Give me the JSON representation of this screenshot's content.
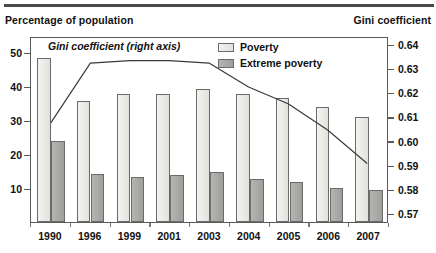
{
  "header": {
    "left_label": "Percentage of population",
    "right_label": "Gini coefficient"
  },
  "annotation": {
    "gini_series_note": "Gini coefficient (right axis)"
  },
  "legend": {
    "items": [
      {
        "label": "Poverty",
        "swatch": "light-gray-bar",
        "color": "#ECEAE6"
      },
      {
        "label": "Extreme poverty",
        "swatch": "dark-gray-bar",
        "color": "#A9A9A6"
      }
    ]
  },
  "chart_data": {
    "type": "bar",
    "title": "",
    "subtitle": "",
    "xlabel": "",
    "ylabel": "Percentage of population",
    "y2label": "Gini coefficient",
    "categories": [
      "1990",
      "1996",
      "1999",
      "2001",
      "2003",
      "2004",
      "2005",
      "2006",
      "2007"
    ],
    "series": [
      {
        "name": "Poverty",
        "kind": "bar",
        "axis": "left",
        "color": "#ECEAE6",
        "values": [
          48.4,
          35.8,
          37.8,
          37.8,
          39.3,
          38.0,
          36.8,
          34.0,
          31.2
        ]
      },
      {
        "name": "Extreme poverty",
        "kind": "bar",
        "axis": "left",
        "color": "#A9A9A6",
        "values": [
          24.0,
          14.3,
          13.2,
          13.8,
          14.9,
          12.6,
          11.7,
          10.2,
          9.6
        ]
      },
      {
        "name": "Gini coefficient (right axis)",
        "kind": "line",
        "axis": "right",
        "color": "#3A3A3A",
        "values": [
          0.608,
          0.633,
          0.634,
          0.634,
          0.633,
          0.623,
          0.616,
          0.605,
          0.591
        ]
      }
    ],
    "ylim": [
      0,
      55
    ],
    "yticks": [
      10,
      20,
      30,
      40,
      50
    ],
    "ytick_labels": [
      "10",
      "20",
      "30",
      "40",
      "50"
    ],
    "y2lim": [
      0.5665,
      0.6435
    ],
    "y2ticks": [
      0.57,
      0.58,
      0.59,
      0.6,
      0.61,
      0.62,
      0.63,
      0.64
    ],
    "y2tick_labels": [
      "0.57",
      "0.58",
      "0.59",
      "0.60",
      "0.61",
      "0.62",
      "0.63",
      "0.64"
    ],
    "grid": false,
    "legend_position": "top-right"
  }
}
